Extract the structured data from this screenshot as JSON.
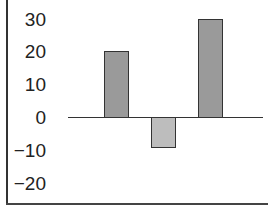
{
  "chart_data": {
    "type": "bar",
    "title": "",
    "xlabel": "",
    "ylabel": "",
    "categories": [
      "",
      "",
      ""
    ],
    "values": [
      20,
      -9,
      30
    ],
    "colors": [
      "#9a9a9a",
      "#bdbdbd",
      "#9a9a9a"
    ],
    "ylim": [
      -20,
      30
    ],
    "yticks": [
      30,
      20,
      10,
      0,
      -10,
      -20
    ],
    "ytick_labels": [
      "30",
      "20",
      "10",
      "0",
      "−10",
      "−20"
    ],
    "grid": false,
    "legend": null
  }
}
